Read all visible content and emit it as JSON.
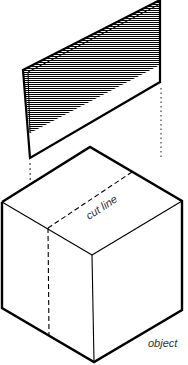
{
  "diagram": {
    "labels": {
      "cut_line": "cut line",
      "object": "object"
    },
    "elements": [
      {
        "id": "section-plane",
        "type": "hatched parallelogram",
        "description": "cutting plane lifted above the object"
      },
      {
        "id": "cube",
        "type": "isometric cube",
        "description": "object being sectioned"
      },
      {
        "id": "cut-line",
        "type": "dashed line",
        "description": "where the plane intersects the cube"
      },
      {
        "id": "projection-lines",
        "type": "dotted lines",
        "description": "guides from plane down to object"
      }
    ],
    "colors": {
      "stroke": "#000000",
      "hatch": "#000000",
      "label": "#333333",
      "background": "#ffffff"
    }
  }
}
